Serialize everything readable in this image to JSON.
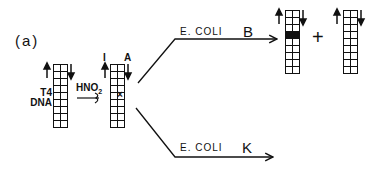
{
  "panel": {
    "label": "(a)"
  },
  "start": {
    "label_line1": "T4",
    "label_line2": "DNA",
    "rows": 9
  },
  "treatment": {
    "reagent": "HNO",
    "subscript": "2"
  },
  "deaminated": {
    "label_left": "I",
    "label_right": "A",
    "rows": 9,
    "mark_row": 4
  },
  "branch_b": {
    "host": "E. COLI",
    "strain": "B"
  },
  "branch_k": {
    "host": "E. COLI",
    "strain": "K"
  },
  "products": {
    "plus": "+",
    "product1_dark_row": 3,
    "rows": 9
  },
  "colors": {
    "ink": "#111111",
    "background": "#ffffff"
  }
}
